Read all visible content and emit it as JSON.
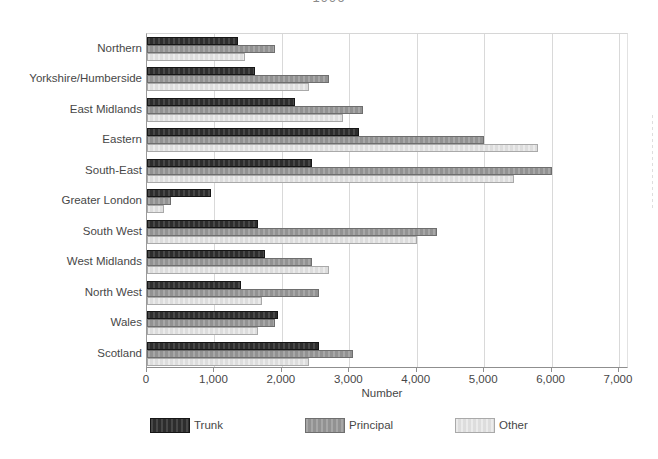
{
  "title_fragment": "1996",
  "chart_data": {
    "type": "bar",
    "orientation": "horizontal",
    "title": "1996 (cropped at top of image)",
    "xlabel": "Number",
    "xlim": [
      0,
      7000
    ],
    "xticks": [
      "0",
      "1,000",
      "2,000",
      "3,000",
      "4,000",
      "5,000",
      "6,000",
      "7,000"
    ],
    "xtick_values": [
      0,
      1000,
      2000,
      3000,
      4000,
      5000,
      6000,
      7000
    ],
    "grid": true,
    "legend_position": "bottom",
    "categories": [
      "Northern",
      "Yorkshire/Humberside",
      "East Midlands",
      "Eastern",
      "South-East",
      "Greater London",
      "South West",
      "West Midlands",
      "North West",
      "Wales",
      "Scotland"
    ],
    "series": [
      {
        "name": "Trunk",
        "color": "#333333",
        "values": [
          1350,
          1600,
          2200,
          3150,
          2450,
          950,
          1650,
          1750,
          1400,
          1950,
          2550
        ]
      },
      {
        "name": "Principal",
        "color": "#9b9b9b",
        "values": [
          1900,
          2700,
          3200,
          5000,
          6000,
          350,
          4300,
          2450,
          2550,
          1900,
          3050
        ]
      },
      {
        "name": "Other",
        "color": "#e4e4e4",
        "values": [
          1450,
          2400,
          2900,
          5800,
          5450,
          250,
          4000,
          2700,
          1700,
          1650,
          2400
        ]
      }
    ]
  },
  "colors": {
    "background": "#ffffff",
    "gridline": "#d9d9d9",
    "axis": "#8f8f8f",
    "text": "#474747"
  }
}
